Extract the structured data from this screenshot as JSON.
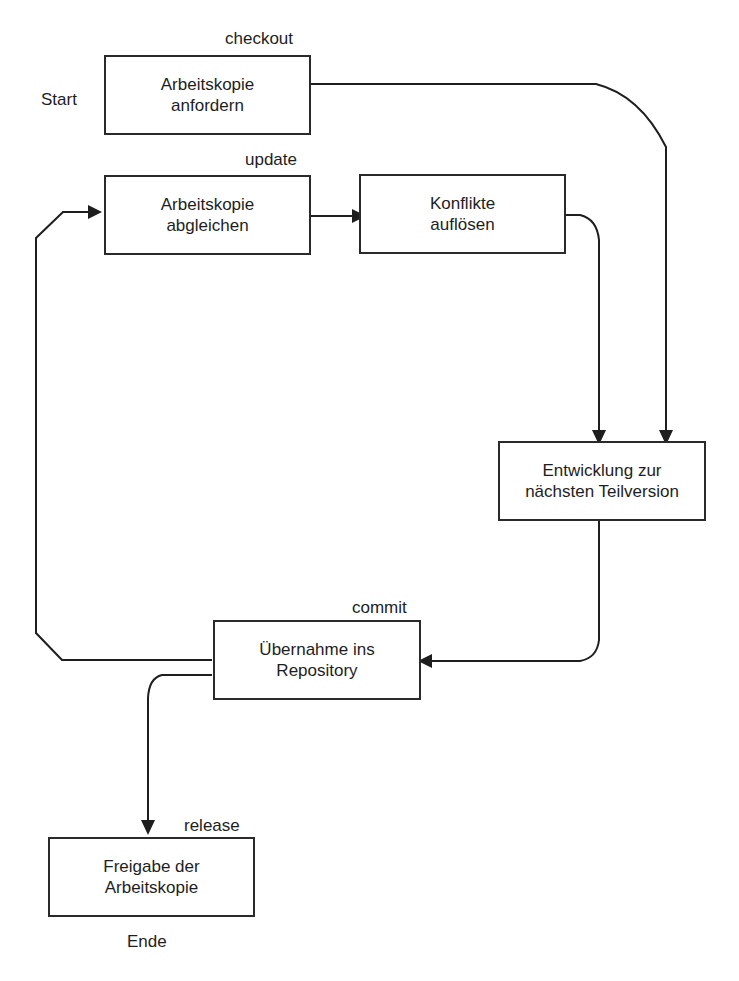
{
  "diagram": {
    "type": "flowchart",
    "terminals": {
      "start": "Start",
      "end": "Ende"
    },
    "nodes": [
      {
        "id": "checkout",
        "command": "checkout",
        "lines": [
          "Arbeitskopie",
          "anfordern"
        ]
      },
      {
        "id": "update",
        "command": "update",
        "lines": [
          "Arbeitskopie",
          "abgleichen"
        ]
      },
      {
        "id": "resolve",
        "command": "",
        "lines": [
          "Konflikte",
          "auflösen"
        ]
      },
      {
        "id": "develop",
        "command": "",
        "lines": [
          "Entwicklung zur",
          "nächsten Teilversion"
        ]
      },
      {
        "id": "commit",
        "command": "commit",
        "lines": [
          "Übernahme ins",
          "Repository"
        ]
      },
      {
        "id": "release",
        "command": "release",
        "lines": [
          "Freigabe der",
          "Arbeitskopie"
        ]
      }
    ],
    "edges": [
      {
        "from": "checkout",
        "to": "develop"
      },
      {
        "from": "update",
        "to": "resolve"
      },
      {
        "from": "resolve",
        "to": "develop"
      },
      {
        "from": "develop",
        "to": "commit"
      },
      {
        "from": "commit",
        "to": "update"
      },
      {
        "from": "commit",
        "to": "release"
      }
    ],
    "colors": {
      "stroke": "#1e1e1e",
      "background": "#ffffff"
    }
  }
}
